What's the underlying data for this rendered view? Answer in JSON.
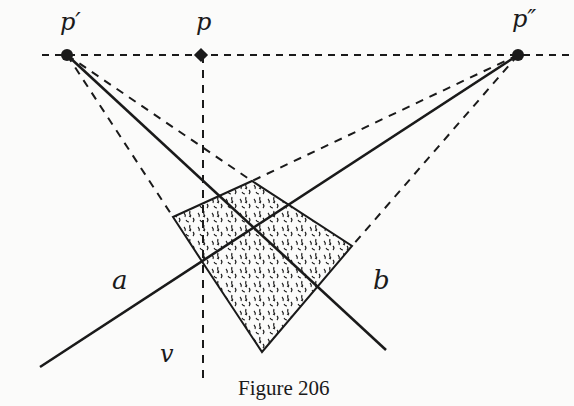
{
  "figure": {
    "caption": "Figure 206",
    "labels": {
      "p_prime": "p′",
      "p": "p",
      "p_double_prime": "p″",
      "a": "a",
      "b": "b",
      "v": "v"
    },
    "colors": {
      "ink": "#1a1a1a",
      "paper": "#fbfbfa"
    },
    "points": {
      "p_prime": [
        67,
        55
      ],
      "p": [
        201,
        55
      ],
      "p_double_prime": [
        518,
        55
      ]
    },
    "stippled_quad": [
      [
        173,
        217
      ],
      [
        252,
        181
      ],
      [
        352,
        246
      ],
      [
        262,
        352
      ],
      [
        205,
        266
      ]
    ]
  }
}
